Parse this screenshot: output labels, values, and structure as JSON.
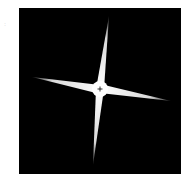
{
  "image": {
    "description": "Four-pointed white star / diffraction-spike shape centered on a black square with a small crosshair at the center",
    "background_color": "#ffffff",
    "frame_color": "#000000",
    "star_color": "#ffffff",
    "crosshair_color": "#000000",
    "stray_mark": ":"
  },
  "geometry": {
    "frame": {
      "x": 19,
      "y": 8,
      "width": 162,
      "height": 166
    },
    "center": {
      "x": 100,
      "y": 89
    },
    "hub_radius": 8,
    "arms": [
      {
        "name": "top",
        "tip": [
          109,
          16
        ]
      },
      {
        "name": "right",
        "tip": [
          171,
          101
        ]
      },
      {
        "name": "bottom",
        "tip": [
          93,
          165
        ]
      },
      {
        "name": "left",
        "tip": [
          32,
          77
        ]
      }
    ]
  }
}
